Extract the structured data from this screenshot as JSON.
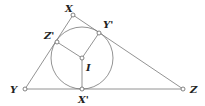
{
  "diagram": {
    "colors": {
      "line": "#777777",
      "point_fill": "#ffffff",
      "point_stroke": "#666666",
      "label": "#222222"
    },
    "incircle": {
      "cx": 82,
      "cy": 58,
      "r": 31
    },
    "points": [
      {
        "id": "X",
        "label": "X",
        "x": 73,
        "y": 15,
        "lx": 65,
        "ly": 12
      },
      {
        "id": "Y",
        "label": "Y",
        "x": 25,
        "y": 89,
        "lx": 10,
        "ly": 93
      },
      {
        "id": "Z",
        "label": "Z",
        "x": 183,
        "y": 89,
        "lx": 190,
        "ly": 93
      },
      {
        "id": "Xp",
        "label": "X'",
        "x": 82,
        "y": 89,
        "lx": 78,
        "ly": 103
      },
      {
        "id": "Yp",
        "label": "Y'",
        "x": 99,
        "y": 33,
        "lx": 103,
        "ly": 28
      },
      {
        "id": "Zp",
        "label": "Z'",
        "x": 57,
        "y": 42,
        "lx": 44,
        "ly": 39
      },
      {
        "id": "I",
        "label": "I",
        "x": 82,
        "y": 58,
        "lx": 86,
        "ly": 71
      }
    ],
    "segments": [
      {
        "id": "XY",
        "from": "X",
        "to": "Y"
      },
      {
        "id": "YZ",
        "from": "Y",
        "to": "Z"
      },
      {
        "id": "ZX",
        "from": "Z",
        "to": "X"
      },
      {
        "id": "IXp",
        "from": "I",
        "to": "Xp"
      },
      {
        "id": "IYp",
        "from": "I",
        "to": "Yp"
      },
      {
        "id": "IZp",
        "from": "I",
        "to": "Zp"
      }
    ]
  }
}
